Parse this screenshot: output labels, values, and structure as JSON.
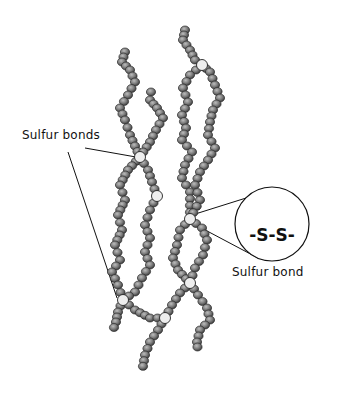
{
  "diagram": {
    "type": "molecular-structure",
    "labels": {
      "sulfur_bonds": "Sulfur bonds",
      "sulfur_bond": "Sulfur bond",
      "callout_formula": "-S-S-"
    },
    "colors": {
      "bead_fill": "#8a8a8a",
      "bead_dark": "#3a3a3a",
      "bond_fill": "#eeeeee",
      "line": "#111111"
    },
    "chains": [
      {
        "id": "chain-a",
        "top": [
          125,
          52
        ],
        "bottom": [
          112,
          333
        ]
      },
      {
        "id": "chain-b",
        "top": [
          151,
          92
        ],
        "bottom": [
          138,
          372
        ]
      },
      {
        "id": "chain-c",
        "top": [
          185,
          30
        ],
        "bottom": [
          198,
          350
        ]
      },
      {
        "id": "chain-d",
        "top": [
          202,
          65
        ],
        "bottom": [
          198,
          352
        ]
      }
    ],
    "bonds": [
      {
        "x": 202,
        "y": 65
      },
      {
        "x": 140,
        "y": 157
      },
      {
        "x": 157,
        "y": 196
      },
      {
        "x": 190,
        "y": 219
      },
      {
        "x": 190,
        "y": 283
      },
      {
        "x": 123,
        "y": 300
      },
      {
        "x": 165,
        "y": 318
      }
    ]
  }
}
